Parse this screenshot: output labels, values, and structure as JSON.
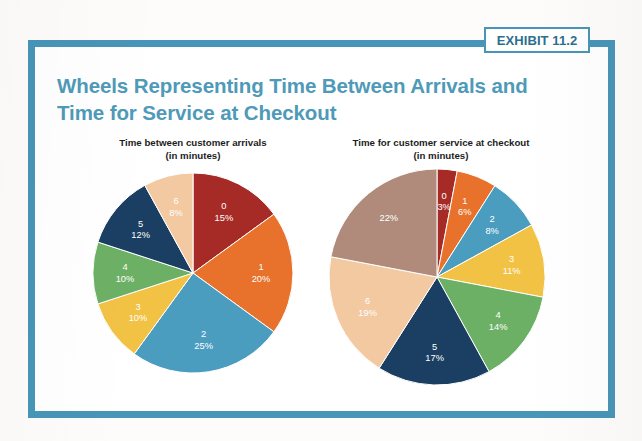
{
  "badge": {
    "label": "EXHIBIT 11.2"
  },
  "title": {
    "line1": "Wheels Representing Time Between Arrivals and",
    "line2": "Time for Service at Checkout"
  },
  "colors": {
    "frame": "#4795b8",
    "badge_border": "#4795b8",
    "badge_text": "#2c6f8e",
    "title": "#4e9ab8",
    "subtitle": "#1d1d1d",
    "slice_label": "#ffffff",
    "palette_dark_red": "#a62b26",
    "palette_orange": "#e8712b",
    "palette_blue": "#4b9dc0",
    "palette_yellow": "#f2c245",
    "palette_green": "#6cb065",
    "palette_navy": "#1b3f63",
    "palette_peach": "#f2c9a0",
    "palette_taupe": "#b08b7b"
  },
  "chart_data": [
    {
      "type": "pie",
      "id": "time-between-arrivals",
      "title": "Time between customer arrivals",
      "subtitle": "(in minutes)",
      "xlabel": "",
      "ylabel": "",
      "legend": "none",
      "categories": [
        "0",
        "1",
        "2",
        "3",
        "4",
        "5",
        "6"
      ],
      "values": [
        15,
        20,
        25,
        10,
        10,
        12,
        8
      ],
      "value_labels": [
        "15%",
        "20%",
        "25%",
        "10%",
        "10%",
        "12%",
        "8%"
      ],
      "colors": [
        "#a62b26",
        "#e8712b",
        "#4b9dc0",
        "#f2c245",
        "#6cb065",
        "#1b3f63",
        "#f2c9a0"
      ],
      "units": "percent",
      "start_angle_deg": 0,
      "direction": "clockwise"
    },
    {
      "type": "pie",
      "id": "time-for-service-at-checkout",
      "title": "Time for customer service at checkout",
      "subtitle": "(in minutes)",
      "xlabel": "",
      "ylabel": "",
      "legend": "none",
      "categories": [
        "0",
        "1",
        "2",
        "3",
        "4",
        "5",
        "6",
        ""
      ],
      "values": [
        3,
        6,
        8,
        11,
        14,
        17,
        19,
        22
      ],
      "value_labels": [
        "3%",
        "6%",
        "8%",
        "11%",
        "14%",
        "17%",
        "19%",
        "22%"
      ],
      "colors": [
        "#a62b26",
        "#e8712b",
        "#4b9dc0",
        "#f2c245",
        "#6cb065",
        "#1b3f63",
        "#f2c9a0",
        "#b08b7b"
      ],
      "units": "percent",
      "start_angle_deg": 0,
      "direction": "clockwise"
    }
  ]
}
